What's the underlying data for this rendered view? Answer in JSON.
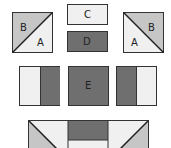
{
  "diagram": {
    "colors": {
      "light": "#f0f0f0",
      "medium": "#c6c6c6",
      "dark": "#6f6f6f",
      "stroke": "#333333",
      "background": "#ffffff"
    },
    "pieces": {
      "hst_left": {
        "labels": [
          "B",
          "A"
        ]
      },
      "rect_c": {
        "label": "C"
      },
      "rect_d": {
        "label": "D"
      },
      "hst_right": {
        "labels": [
          "B",
          "A"
        ]
      },
      "square_e": {
        "label": "E"
      },
      "split_left": {
        "labels": []
      },
      "split_right": {
        "labels": []
      },
      "assembled_block": {
        "labels": []
      }
    }
  }
}
